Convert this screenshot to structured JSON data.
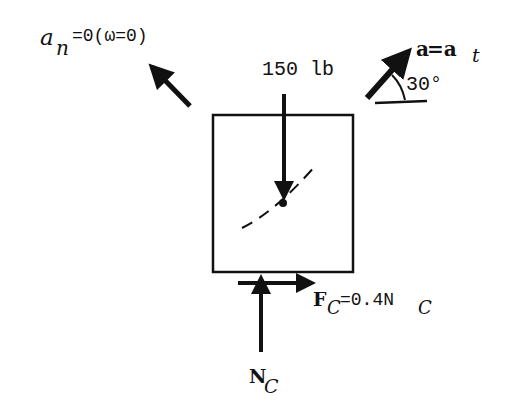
{
  "diagram": {
    "labels": {
      "an_main": "a",
      "an_sub": "n",
      "an_rest": "=0(ω=0)",
      "weight": "150 lb",
      "a_main": "a",
      "a_eq": " =a",
      "a_sub": "t",
      "angle": "30°",
      "fc_main": "F",
      "fc_sub": "C",
      "fc_eq": "=0.4N",
      "fc_sub2": "C",
      "nc_main": "N",
      "nc_sub": "C"
    },
    "elements": {
      "block": {
        "x": 213,
        "y": 115,
        "w": 140,
        "h": 157
      },
      "mass_center": {
        "x": 283,
        "y": 203
      },
      "weight_force": {
        "magnitude": "150 lb",
        "direction": "down"
      },
      "normal_force": {
        "name": "N_C",
        "direction": "up"
      },
      "friction_force": {
        "name": "F_C",
        "expression": "0.4 N_C",
        "direction": "right"
      },
      "normal_accel": {
        "name": "a_n",
        "value": 0,
        "note": "ω=0",
        "direction": "up-left"
      },
      "tangential_accel": {
        "name": "a = a_t",
        "angle_deg": 30,
        "direction": "up-right"
      }
    },
    "colors": {
      "ink": "#111111",
      "background": "#ffffff"
    }
  }
}
